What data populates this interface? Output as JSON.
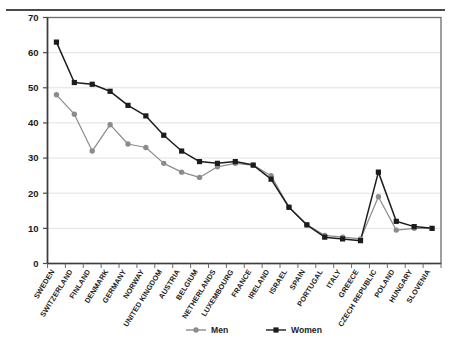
{
  "chart_data": {
    "type": "line",
    "title": "",
    "xlabel": "",
    "ylabel": "",
    "ylim": [
      0,
      70
    ],
    "ytick_step": 10,
    "yticks": [
      0,
      10,
      20,
      30,
      40,
      50,
      60,
      70
    ],
    "grid": true,
    "grid_axis": "y",
    "legend_position": "bottom-center",
    "categories": [
      "SWEDEN",
      "SWITZERLAND",
      "FINLAND",
      "DENMARK",
      "GERMANY",
      "NORWAY",
      "UNITED KINGDOM",
      "AUSTRIA",
      "BELGIUM",
      "NETHERLANDS",
      "LUXEMBOURG",
      "FRANCE",
      "IRELAND",
      "ISRAEL",
      "SPAIN",
      "PORTUGAL",
      "ITALY",
      "GREECE",
      "CZECH REPUBLIC",
      "POLAND",
      "HUNGARY",
      "SLOVENIA"
    ],
    "series": [
      {
        "name": "Men",
        "color": "#8c8c8c",
        "marker": "circle",
        "values": [
          48,
          42.5,
          32,
          39.5,
          34,
          33,
          28.5,
          26,
          24.5,
          27.5,
          28.5,
          28,
          25,
          16,
          11,
          8,
          7.5,
          7,
          19,
          9.5,
          10,
          10
        ]
      },
      {
        "name": "Women",
        "color": "#1c1c1c",
        "marker": "square",
        "values": [
          63,
          51.5,
          51,
          49,
          45,
          42,
          36.5,
          32,
          29,
          28.5,
          29,
          28,
          24,
          16,
          11,
          7.5,
          7,
          6.5,
          26,
          12,
          10.5,
          10
        ]
      }
    ]
  },
  "legend": {
    "items": [
      {
        "label": "Men"
      },
      {
        "label": "Women"
      }
    ]
  }
}
